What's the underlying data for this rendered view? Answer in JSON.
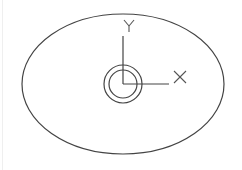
{
  "diagram": {
    "type": "cad-ucs-icon-on-ellipse",
    "stroke_color": "#444444",
    "background": "#ffffff",
    "ellipse": {
      "cx": 123,
      "cy": 84,
      "rx": 101,
      "ry": 70
    },
    "outer_circle": {
      "cx": 123,
      "cy": 84,
      "r": 19
    },
    "inner_circle": {
      "cx": 123,
      "cy": 84,
      "r": 14
    },
    "origin": {
      "x": 123,
      "y": 84
    },
    "y_axis": {
      "label": "Y",
      "end_y": 36
    },
    "x_axis": {
      "label": "X",
      "end_x": 169
    }
  }
}
